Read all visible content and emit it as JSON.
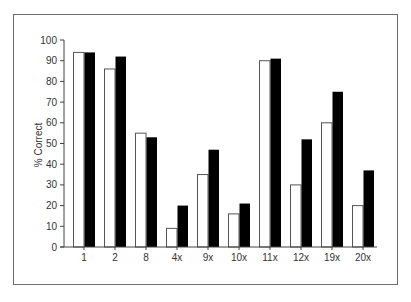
{
  "chart_data": {
    "type": "bar",
    "title": "",
    "xlabel": "",
    "ylabel": "% Correct",
    "ylim": [
      0,
      100
    ],
    "yticks": [
      0,
      10,
      20,
      30,
      40,
      50,
      60,
      70,
      80,
      90,
      100
    ],
    "grid": false,
    "legend": null,
    "categories": [
      "1",
      "2",
      "8",
      "4x",
      "9x",
      "10x",
      "11x",
      "12x",
      "19x",
      "20x"
    ],
    "series": [
      {
        "name": "white",
        "fill": "#ffffff",
        "stroke": "#555555",
        "values": [
          94,
          86,
          55,
          9,
          35,
          16,
          90,
          30,
          60,
          20
        ]
      },
      {
        "name": "black",
        "fill": "#000000",
        "stroke": "#000000",
        "values": [
          94,
          92,
          53,
          20,
          47,
          21,
          91,
          52,
          75,
          37
        ]
      }
    ]
  },
  "colors": {
    "frame": "#6e6e6e",
    "axis": "#444444",
    "text": "#333333"
  }
}
